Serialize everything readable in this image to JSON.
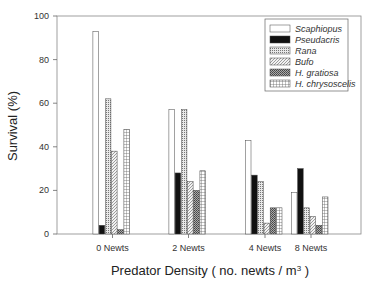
{
  "chart_data": {
    "type": "bar",
    "title": "",
    "xlabel": "Predator Density ( no. newts /  m",
    "xlabel_superscript": "3",
    "xlabel_close": " )",
    "ylabel": "Survival (%)",
    "ylim": [
      0,
      100
    ],
    "yticks": [
      0,
      20,
      40,
      60,
      80,
      100
    ],
    "grid": false,
    "legend_position": "upper right",
    "categories": [
      "0 Newts",
      "2 Newts",
      "4 Newts",
      "8 Newts"
    ],
    "series": [
      {
        "name": "Scaphiopus",
        "pattern": "white",
        "values": [
          93,
          57,
          43,
          19
        ]
      },
      {
        "name": "Pseudacris",
        "pattern": "black",
        "values": [
          4,
          28,
          27,
          30
        ]
      },
      {
        "name": "Rana",
        "pattern": "fine-dots",
        "values": [
          62,
          57,
          24,
          12
        ]
      },
      {
        "name": "Bufo",
        "pattern": "diagonal-hatch",
        "values": [
          38,
          24,
          5,
          8
        ]
      },
      {
        "name": "H. gratiosa",
        "pattern": "dark-crosshatch",
        "values": [
          2,
          20,
          12,
          4
        ]
      },
      {
        "name": "H. chrysoscelis",
        "pattern": "grid",
        "values": [
          48,
          29,
          12,
          17
        ]
      }
    ]
  }
}
